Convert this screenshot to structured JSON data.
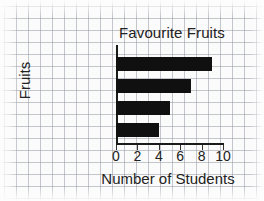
{
  "chart_data": {
    "type": "bar",
    "orientation": "horizontal",
    "title": "Favourite Fruits",
    "xlabel": "Number of Students",
    "ylabel": "Fruits",
    "categories": [
      "Apple",
      "Banana",
      "Orange",
      "Strawberry"
    ],
    "values": [
      9,
      7,
      5,
      4
    ],
    "xlim": [
      0,
      10
    ],
    "xticks": [
      0,
      2,
      4,
      6,
      8,
      10
    ],
    "xtick_labels": [
      "0",
      "2",
      "4",
      "6",
      "8",
      "10"
    ],
    "grid": true,
    "legend": null,
    "bar_color": "#101010",
    "axis_color": "#1a1a1a",
    "grid_color": "#969ba5",
    "background_color": "#fbfbfb"
  }
}
